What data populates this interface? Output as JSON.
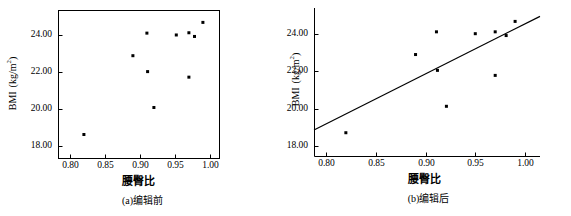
{
  "figure": {
    "background_color": "#ffffff",
    "ink_color": "#000000",
    "panel_count": 2
  },
  "chart_data": [
    {
      "id": "panel-a",
      "type": "scatter",
      "title": "",
      "caption": "(a)编辑前",
      "xlabel": "腰臀比",
      "ylabel_main": "BMI",
      "ylabel_unit": "(kg/m",
      "ylabel_unit_sup": "2",
      "ylabel_unit_end": ")",
      "ylabel": "BMI (kg/m2)",
      "xlim": [
        0.783,
        1.013
      ],
      "ylim": [
        17.35,
        25.35
      ],
      "xticks": [
        0.8,
        0.85,
        0.9,
        0.95,
        1.0
      ],
      "xticklabels": [
        "0.80",
        "0.85",
        "0.90",
        "0.95",
        "1.00"
      ],
      "yticks": [
        18.0,
        20.0,
        22.0,
        24.0
      ],
      "yticklabels": [
        "18.00",
        "20.00",
        "22.00",
        "24.00"
      ],
      "grid": false,
      "frame": "box",
      "legend": "none",
      "marker": "square",
      "marker_size_px": 3,
      "points": [
        {
          "x": 0.82,
          "y": 18.62
        },
        {
          "x": 0.89,
          "y": 22.88
        },
        {
          "x": 0.91,
          "y": 24.1
        },
        {
          "x": 0.911,
          "y": 22.02
        },
        {
          "x": 0.92,
          "y": 20.08
        },
        {
          "x": 0.952,
          "y": 24.0
        },
        {
          "x": 0.97,
          "y": 24.12
        },
        {
          "x": 0.97,
          "y": 21.72
        },
        {
          "x": 0.978,
          "y": 23.92
        },
        {
          "x": 0.99,
          "y": 24.68
        }
      ],
      "trendline": null
    },
    {
      "id": "panel-b",
      "type": "scatter",
      "title": "",
      "caption": "(b)编辑后",
      "xlabel": "腰臀比",
      "ylabel_main": "BMI",
      "ylabel_unit": "(kg/m",
      "ylabel_unit_sup": "2",
      "ylabel_unit_end": ")",
      "ylabel": "BMI (kg/m2)",
      "xlim": [
        0.788,
        1.015
      ],
      "ylim": [
        17.45,
        25.4
      ],
      "xticks": [
        0.8,
        0.85,
        0.9,
        0.95,
        1.0
      ],
      "xticklabels": [
        "0.80",
        "0.85",
        "0.90",
        "0.95",
        "1.00"
      ],
      "yticks": [
        18.0,
        20.0,
        22.0,
        24.0
      ],
      "yticklabels": [
        "18.00",
        "20.00",
        "22.00",
        "24.00"
      ],
      "grid": false,
      "frame": "left-bottom",
      "legend": "none",
      "marker": "square",
      "marker_size_px": 3,
      "points": [
        {
          "x": 0.82,
          "y": 18.7
        },
        {
          "x": 0.89,
          "y": 22.9
        },
        {
          "x": 0.911,
          "y": 24.12
        },
        {
          "x": 0.912,
          "y": 22.05
        },
        {
          "x": 0.921,
          "y": 20.12
        },
        {
          "x": 0.95,
          "y": 24.02
        },
        {
          "x": 0.97,
          "y": 24.12
        },
        {
          "x": 0.97,
          "y": 21.78
        },
        {
          "x": 0.981,
          "y": 23.92
        },
        {
          "x": 0.99,
          "y": 24.68
        }
      ],
      "trendline": {
        "type": "linear-fit",
        "x_start": 0.788,
        "y_start": 18.85,
        "x_end": 1.015,
        "y_end": 24.95
      }
    }
  ]
}
